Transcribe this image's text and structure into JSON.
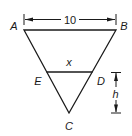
{
  "diagram": {
    "type": "geometry-triangle",
    "vertices": {
      "A": {
        "label": "A"
      },
      "B": {
        "label": "B"
      },
      "C": {
        "label": "C"
      },
      "D": {
        "label": "D"
      },
      "E": {
        "label": "E"
      }
    },
    "segments": {
      "AB": {
        "length_label": "10"
      },
      "ED": {
        "length_label": "x"
      }
    },
    "dimensions": {
      "top_width": "10",
      "height_ED_to_C": "h"
    },
    "colors": {
      "stroke": "#1a1a1a",
      "background": "#ffffff"
    }
  }
}
